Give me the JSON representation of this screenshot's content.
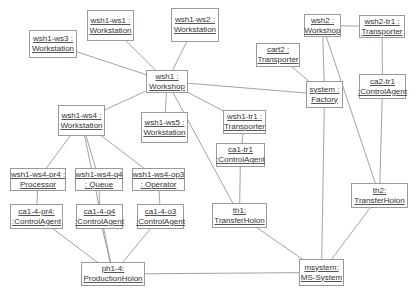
{
  "nodes": [
    {
      "id": "wsh1-ws3",
      "line1": "wsh1-ws3 :",
      "line2": "Workstation"
    },
    {
      "id": "wsh1-ws1",
      "line1": "wsh1-ws1 :",
      "line2": "Workstation"
    },
    {
      "id": "wsh1-ws2",
      "line1": "wsh1-ws2 :",
      "line2": "Workstation"
    },
    {
      "id": "wsh1",
      "line1": "wsh1 :",
      "line2": "Workshop"
    },
    {
      "id": "wsh2",
      "line1": "wsh2 :",
      "line2": "Workshop"
    },
    {
      "id": "wsh2-tr1",
      "line1": "wsh2-tr1 :",
      "line2": "Transporter"
    },
    {
      "id": "cart2",
      "line1": "cart2 :",
      "line2": "Transporter"
    },
    {
      "id": "system",
      "line1": "system :",
      "line2": "Factory"
    },
    {
      "id": "ca2-tr1",
      "line1": "ca2-tr1",
      "line2": ":ControlAgent"
    },
    {
      "id": "wsh1-ws4",
      "line1": "wsh1-ws4 :",
      "line2": "Workstation"
    },
    {
      "id": "wsh1-ws5",
      "line1": "wsh1-ws5 :",
      "line2": "Workstation"
    },
    {
      "id": "wsh1-tr1",
      "line1": "wsh1-tr1 :",
      "line2": "Transporter"
    },
    {
      "id": "ca1-tr1",
      "line1": "ca1-tr1",
      "line2": ":ControlAgent"
    },
    {
      "id": "wsh1-ws4-pr4",
      "line1": "wsh1-ws4-pr4 :",
      "line2": "Processor"
    },
    {
      "id": "wsh1-ws4-q4",
      "line1": "wsh1-ws4-q4",
      "line2": ": Queue"
    },
    {
      "id": "wsh1-ws4-op3",
      "line1": "wsh1-ws4-op3",
      "line2": ": Operator"
    },
    {
      "id": "ca1-4-pr4",
      "line1": "ca1-4-pr4:",
      "line2": ":ControlAgent"
    },
    {
      "id": "ca1-4-q4",
      "line1": "ca1-4-q4",
      "line2": ":ControlAgent"
    },
    {
      "id": "ca1-4-o3",
      "line1": "ca1-4-o3",
      "line2": ":ControlAgent"
    },
    {
      "id": "th1",
      "line1": "th1:",
      "line2": "TransferHolon"
    },
    {
      "id": "th2",
      "line1": "th2:",
      "line2": "TransferHolon"
    },
    {
      "id": "ph1-4",
      "line1": "ph1-4:",
      "line2": "ProductionHolon"
    },
    {
      "id": "msystem",
      "line1": "msystem:",
      "line2": "MS-System"
    }
  ],
  "links": [
    [
      "wsh1-ws3",
      "wsh1"
    ],
    [
      "wsh1-ws1",
      "wsh1"
    ],
    [
      "wsh1-ws2",
      "wsh1"
    ],
    [
      "wsh1",
      "wsh1-ws4"
    ],
    [
      "wsh1",
      "wsh1-ws5"
    ],
    [
      "wsh1",
      "system"
    ],
    [
      "wsh1",
      "wsh1-tr1"
    ],
    [
      "wsh1",
      "th1"
    ],
    [
      "wsh2",
      "wsh2-tr1"
    ],
    [
      "wsh2",
      "system"
    ],
    [
      "wsh2",
      "th2"
    ],
    [
      "cart2",
      "system"
    ],
    [
      "wsh2-tr1",
      "ca2-tr1"
    ],
    [
      "ca2-tr1",
      "th2"
    ],
    [
      "wsh1-tr1",
      "ca1-tr1"
    ],
    [
      "ca1-tr1",
      "th1"
    ],
    [
      "wsh1-ws4",
      "wsh1-ws4-pr4"
    ],
    [
      "wsh1-ws4",
      "wsh1-ws4-q4"
    ],
    [
      "wsh1-ws4",
      "wsh1-ws4-op3"
    ],
    [
      "wsh1-ws4",
      "ph1-4"
    ],
    [
      "wsh1-ws4-pr4",
      "ca1-4-pr4"
    ],
    [
      "wsh1-ws4-q4",
      "ca1-4-q4"
    ],
    [
      "wsh1-ws4-op3",
      "ca1-4-o3"
    ],
    [
      "ca1-4-pr4",
      "ph1-4"
    ],
    [
      "ca1-4-q4",
      "ph1-4"
    ],
    [
      "ca1-4-o3",
      "ph1-4"
    ],
    [
      "ph1-4",
      "msystem"
    ],
    [
      "th1",
      "msystem"
    ],
    [
      "th2",
      "msystem"
    ],
    [
      "system",
      "msystem"
    ]
  ]
}
